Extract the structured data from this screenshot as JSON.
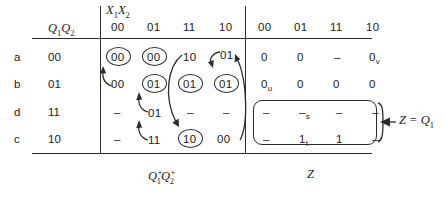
{
  "figure": {
    "title_left_header": "Q₁1Q₁2",
    "input_header": "X₁1X₁2",
    "footer_left": "Q₁1⁺Q₁2⁺",
    "footer_right": "Z",
    "annotation": "Z = Q₁1",
    "ink_color": "#2b2b2b",
    "paper_color": "#ffffff"
  },
  "headers": {
    "state_label": "Q",
    "state_sub1": "1",
    "state_sub2": "2",
    "input_label": "X",
    "input_sub1": "1",
    "input_sub2": "2",
    "columns": [
      "00",
      "01",
      "11",
      "10"
    ]
  },
  "rows": [
    {
      "name": "a",
      "state": "00"
    },
    {
      "name": "b",
      "state": "01"
    },
    {
      "name": "d",
      "state": "11"
    },
    {
      "name": "c",
      "state": "10"
    }
  ],
  "next_state_table": {
    "caption": "Q1+Q2+",
    "cells": [
      [
        {
          "v": "00",
          "circled": true
        },
        {
          "v": "00",
          "circled": true
        },
        {
          "v": "10",
          "circled": false
        },
        {
          "v": "01",
          "circled": false
        }
      ],
      [
        {
          "v": "00",
          "circled": false
        },
        {
          "v": "01",
          "circled": true
        },
        {
          "v": "01",
          "circled": true
        },
        {
          "v": "01",
          "circled": true
        }
      ],
      [
        {
          "v": "–",
          "circled": false
        },
        {
          "v": "01",
          "circled": false
        },
        {
          "v": "–",
          "circled": false
        },
        {
          "v": "–",
          "circled": false
        }
      ],
      [
        {
          "v": "–",
          "circled": false
        },
        {
          "v": "11",
          "circled": false
        },
        {
          "v": "10",
          "circled": true
        },
        {
          "v": "00",
          "circled": false
        }
      ]
    ]
  },
  "output_table": {
    "caption": "Z",
    "cells": [
      [
        {
          "v": "0",
          "sub": ""
        },
        {
          "v": "0",
          "sub": ""
        },
        {
          "v": "–",
          "sub": ""
        },
        {
          "v": "0",
          "sub": "v"
        }
      ],
      [
        {
          "v": "0",
          "sub": "u"
        },
        {
          "v": "0",
          "sub": ""
        },
        {
          "v": "0",
          "sub": ""
        },
        {
          "v": "0",
          "sub": ""
        }
      ],
      [
        {
          "v": "–",
          "sub": ""
        },
        {
          "v": "–",
          "sub": "s"
        },
        {
          "v": "–",
          "sub": ""
        },
        {
          "v": "–",
          "sub": ""
        }
      ],
      [
        {
          "v": "–",
          "sub": ""
        },
        {
          "v": "1",
          "sub": "t"
        },
        {
          "v": "1",
          "sub": ""
        },
        {
          "v": "–",
          "sub": ""
        }
      ]
    ],
    "highlight_box_rows": [
      2,
      3
    ]
  },
  "annotation_callout": {
    "text": "Z = Q",
    "subscript": "1",
    "arrow": "left-arrow"
  }
}
